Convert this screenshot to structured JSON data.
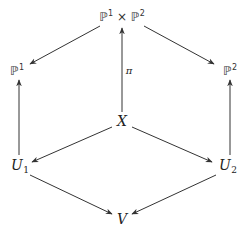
{
  "diagram": {
    "type": "commutative-diagram",
    "nodes": {
      "product": {
        "base1": "ℙ",
        "exp1": "1",
        "times": " × ",
        "base2": "ℙ",
        "exp2": "2"
      },
      "p1": {
        "base": "ℙ",
        "exp": "1"
      },
      "p2": {
        "base": "ℙ",
        "exp": "2"
      },
      "x": {
        "label": "X"
      },
      "u1": {
        "base": "U",
        "sub": "1"
      },
      "u2": {
        "base": "U",
        "sub": "2"
      },
      "v": {
        "label": "V"
      }
    },
    "edges": [
      {
        "from": "product",
        "to": "p1",
        "label": ""
      },
      {
        "from": "product",
        "to": "p2",
        "label": ""
      },
      {
        "from": "x",
        "to": "product",
        "label": "π"
      },
      {
        "from": "u1",
        "to": "p1",
        "label": ""
      },
      {
        "from": "u2",
        "to": "p2",
        "label": ""
      },
      {
        "from": "x",
        "to": "u1",
        "label": ""
      },
      {
        "from": "x",
        "to": "u2",
        "label": ""
      },
      {
        "from": "u1",
        "to": "v",
        "label": ""
      },
      {
        "from": "u2",
        "to": "v",
        "label": ""
      }
    ],
    "pi_label": "π",
    "colors": {
      "line": "#333333",
      "text": "#222222",
      "background": "#ffffff"
    }
  }
}
